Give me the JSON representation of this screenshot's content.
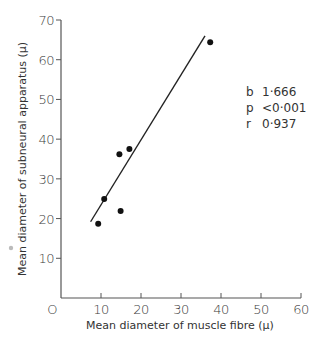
{
  "chart_data": {
    "type": "scatter",
    "title": "",
    "xlabel": "Mean diameter of muscle fibre (μ)",
    "ylabel": "Mean diameter of subneural apparatus (μ)",
    "xlim": [
      0,
      60
    ],
    "ylim": [
      0,
      70
    ],
    "x_ticks": [
      "O",
      "10",
      "20",
      "30",
      "40",
      "50",
      "60"
    ],
    "y_ticks": [
      "10",
      "20",
      "30",
      "40",
      "50",
      "60",
      "70"
    ],
    "grid": false,
    "series": [
      {
        "name": "observations",
        "points": [
          {
            "x": 9.3,
            "y": 18.7
          },
          {
            "x": 10.8,
            "y": 24.9
          },
          {
            "x": 14.6,
            "y": 36.2
          },
          {
            "x": 14.9,
            "y": 21.9
          },
          {
            "x": 17.1,
            "y": 37.5
          },
          {
            "x": 37.3,
            "y": 64.4
          }
        ]
      }
    ],
    "regression_line": {
      "x1": 7.4,
      "y1": 19.2,
      "x2": 36.0,
      "y2": 66.0
    },
    "annotations": {
      "b_label": "b",
      "b_value": "1·666",
      "p_label": "p",
      "p_value": "<0·001",
      "r_label": "r",
      "r_value": "0·937"
    }
  }
}
